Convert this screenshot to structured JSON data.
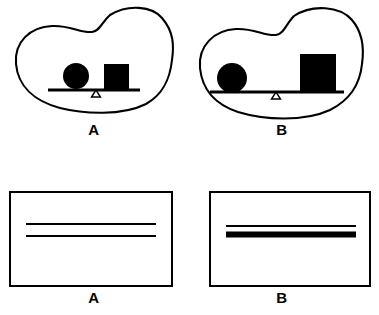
{
  "figure": {
    "title": "",
    "background_color": "#ffffff",
    "ink_color": "#000000"
  },
  "top_row": {
    "panels": [
      {
        "label": "A",
        "name": "balance-scale-a",
        "description": "Balance beam inside irregular blob outline; circle and square placed close to the fulcrum",
        "blob_outline": "M 12,62 C 10,40 26,25 48,24 C 66,23 76,31 88,30 C 96,29 98,20 106,13 C 124,2 148,4 158,16 C 170,30 170,44 168,58 C 166,76 160,92 142,102 C 118,114 80,112 56,106 C 30,99 14,84 12,62 Z",
        "beam": {
          "x1": 44,
          "y1": 88,
          "x2": 136,
          "y2": 88,
          "thickness": 3
        },
        "fulcrum": {
          "x": 92,
          "y": 88,
          "width": 9,
          "height": 7
        },
        "circle": {
          "cx": 72,
          "cy": 74,
          "r": 13
        },
        "square": {
          "x": 100,
          "y": 62,
          "width": 25,
          "height": 25
        }
      },
      {
        "label": "B",
        "name": "balance-scale-b",
        "description": "Balance beam inside irregular blob outline; circle far left and a larger square far right of the fulcrum",
        "blob_outline": "M 8,66 C 6,44 22,28 44,27 C 62,26 72,34 84,33 C 92,32 94,22 102,14 C 120,2 148,4 160,18 C 172,32 172,48 170,62 C 168,82 158,98 138,108 C 112,120 72,118 46,110 C 22,102 10,86 8,66 Z",
        "beam": {
          "x1": 18,
          "y1": 90,
          "x2": 152,
          "y2": 90,
          "thickness": 3
        },
        "fulcrum": {
          "x": 84,
          "y": 90,
          "width": 9,
          "height": 7
        },
        "circle": {
          "cx": 40,
          "cy": 76,
          "r": 15
        },
        "square": {
          "x": 108,
          "y": 52,
          "width": 36,
          "height": 37
        }
      }
    ]
  },
  "bottom_row": {
    "panels": [
      {
        "label": "A",
        "name": "line-box-a",
        "description": "Rectangle containing two thin horizontal lines of equal weight, separated by a gap",
        "rect": {
          "x": 6,
          "y": 6,
          "width": 162,
          "height": 94,
          "stroke": 2
        },
        "lines": [
          {
            "x1": 22,
            "y1": 38,
            "x2": 152,
            "y2": 38,
            "thickness": 2
          },
          {
            "x1": 22,
            "y1": 50,
            "x2": 152,
            "y2": 50,
            "thickness": 2
          }
        ]
      },
      {
        "label": "B",
        "name": "line-box-b",
        "description": "Rectangle containing a thin horizontal line above a thick bold horizontal line, close together",
        "rect": {
          "x": 18,
          "y": 6,
          "width": 160,
          "height": 94,
          "stroke": 2
        },
        "lines": [
          {
            "x1": 34,
            "y1": 40,
            "x2": 164,
            "y2": 40,
            "thickness": 2
          },
          {
            "x1": 34,
            "y1": 48,
            "x2": 164,
            "y2": 48,
            "thickness": 6
          }
        ]
      }
    ]
  }
}
